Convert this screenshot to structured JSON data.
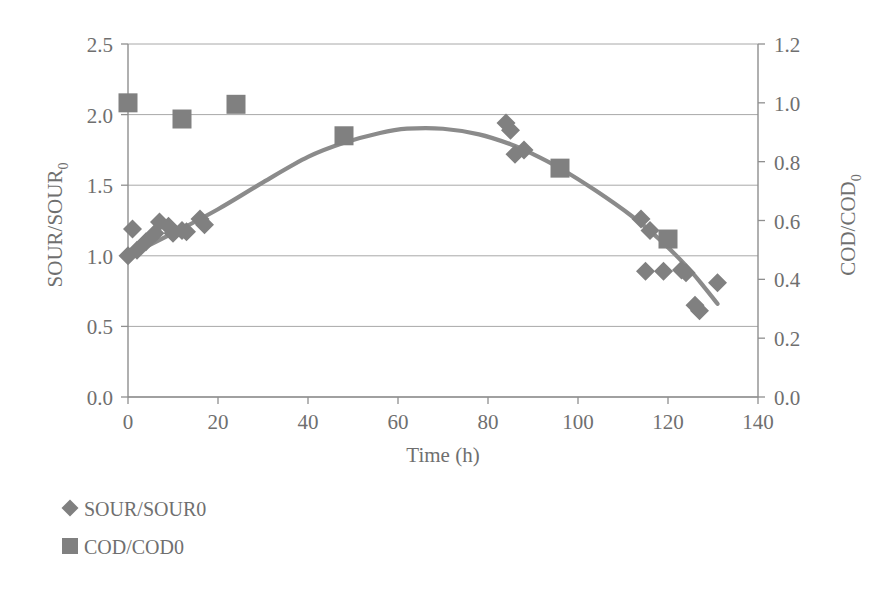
{
  "chart_data": {
    "type": "scatter",
    "title": "",
    "xlabel": "Time (h)",
    "ylabel": "SOUR/SOUR0",
    "y2label": "COD/COD0",
    "xlim": [
      0,
      140
    ],
    "ylim": [
      0.0,
      2.5
    ],
    "y2lim": [
      0.0,
      1.2
    ],
    "xticks": [
      0,
      20,
      40,
      60,
      80,
      100,
      120,
      140
    ],
    "yticks": [
      "0.0",
      "0.5",
      "1.0",
      "1.5",
      "2.0",
      "2.5"
    ],
    "y2ticks": [
      "0.0",
      "0.2",
      "0.4",
      "0.6",
      "0.8",
      "1.0",
      "1.2"
    ],
    "grid": true,
    "legend_position": "below-left",
    "marker_color": "#808080",
    "curve_color": "#8b8b8b",
    "series": [
      {
        "name": "SOUR/SOUR0",
        "marker": "diamond",
        "axis": "left",
        "points": [
          [
            0,
            1.0
          ],
          [
            1,
            1.19
          ],
          [
            2,
            1.04
          ],
          [
            4,
            1.1
          ],
          [
            6,
            1.16
          ],
          [
            7,
            1.24
          ],
          [
            9,
            1.21
          ],
          [
            10,
            1.16
          ],
          [
            12,
            1.18
          ],
          [
            13,
            1.17
          ],
          [
            16,
            1.26
          ],
          [
            17,
            1.22
          ],
          [
            84,
            1.94
          ],
          [
            85,
            1.89
          ],
          [
            86,
            1.72
          ],
          [
            88,
            1.75
          ],
          [
            114,
            1.26
          ],
          [
            116,
            1.18
          ],
          [
            115,
            0.89
          ],
          [
            119,
            0.89
          ],
          [
            123,
            0.9
          ],
          [
            124,
            0.88
          ],
          [
            126,
            0.65
          ],
          [
            127,
            0.61
          ],
          [
            131,
            0.81
          ]
        ]
      },
      {
        "name": "COD/COD0",
        "marker": "square",
        "axis": "right",
        "points": [
          [
            0,
            1.0
          ],
          [
            12,
            0.945
          ],
          [
            24,
            0.995
          ],
          [
            48,
            0.888
          ],
          [
            96,
            0.778
          ],
          [
            120,
            0.537
          ]
        ]
      }
    ],
    "trend_curve": {
      "description": "smooth fitted curve through SOUR/SOUR0 data (left axis)",
      "axis": "left",
      "points": [
        [
          0,
          1.0
        ],
        [
          10,
          1.16
        ],
        [
          20,
          1.33
        ],
        [
          30,
          1.52
        ],
        [
          40,
          1.7
        ],
        [
          48,
          1.8
        ],
        [
          56,
          1.87
        ],
        [
          62,
          1.9
        ],
        [
          70,
          1.9
        ],
        [
          78,
          1.86
        ],
        [
          85,
          1.79
        ],
        [
          90,
          1.72
        ],
        [
          96,
          1.62
        ],
        [
          104,
          1.46
        ],
        [
          112,
          1.28
        ],
        [
          118,
          1.12
        ],
        [
          124,
          0.93
        ],
        [
          128,
          0.78
        ],
        [
          131,
          0.66
        ]
      ]
    }
  },
  "legend": {
    "items": [
      {
        "label": "SOUR/SOUR0",
        "marker": "diamond"
      },
      {
        "label": "COD/COD0",
        "marker": "square"
      }
    ]
  },
  "axes": {
    "left_title_main": "SOUR/SOUR",
    "left_title_sub": "0",
    "right_title_main": "COD/COD",
    "right_title_sub": "0",
    "x_title": "Time (h)"
  }
}
